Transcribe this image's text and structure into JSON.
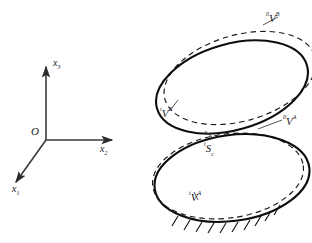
{
  "figure": {
    "background_color": "#ffffff",
    "stroke_color": "#1a1a1a"
  },
  "axes": {
    "origin_label": "O",
    "x1": {
      "pre": "",
      "main": "x",
      "sub": "1"
    },
    "x2": {
      "pre": "",
      "main": "x",
      "sub": "2"
    },
    "x3": {
      "pre": "",
      "main": "x",
      "sub": "3"
    }
  },
  "labels": {
    "upper_reference": {
      "pre": "0",
      "main": "V",
      "sup": "B",
      "sub": ""
    },
    "upper_current": {
      "pre": "t",
      "main": "V",
      "sup": "B",
      "sub": ""
    },
    "lower_reference": {
      "pre": "0",
      "main": "V",
      "sup": "A",
      "sub": ""
    },
    "lower_current": {
      "pre": "t",
      "main": "V",
      "sup": "A",
      "sub": ""
    },
    "contact_surface": {
      "pre": "t",
      "main": "S",
      "sup": "",
      "sub": "c"
    }
  },
  "geometry": {
    "upper_solid_ellipse": {
      "cx": 232,
      "cy": 87,
      "rx": 78,
      "ry": 43,
      "rotation": -16
    },
    "upper_dashed_ellipse": {
      "cx": 240,
      "cy": 78,
      "rx": 78,
      "ry": 43,
      "rotation": -16
    },
    "lower_solid_ellipse": {
      "cx": 232,
      "cy": 178,
      "rx": 78,
      "ry": 43,
      "rotation": -8
    },
    "lower_dashed_ellipse": {
      "cx": 228,
      "cy": 176,
      "rx": 76,
      "ry": 42,
      "rotation": -8
    },
    "hatch_count": 9
  },
  "styles": {
    "solid_line": "solid",
    "dashed_line": "dashed",
    "ground_hatching": "diagonal-ticks"
  }
}
